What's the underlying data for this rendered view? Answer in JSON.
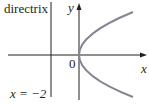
{
  "diagram": {
    "type": "parabola-with-directrix",
    "labels": {
      "directrix": "directrix",
      "directrix_equation": "x = −2",
      "origin": "0",
      "y_axis": "y",
      "x_axis": "x"
    },
    "colors": {
      "axes": "#231f20",
      "parabola": "#8a8290"
    }
  }
}
